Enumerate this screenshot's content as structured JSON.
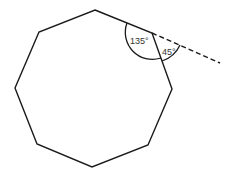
{
  "diagram": {
    "type": "regular-octagon-exterior-angle",
    "shape": "octagon",
    "stroke_color": "#1a1a1a",
    "background": "#ffffff",
    "vertices": [
      [
        95,
        10
      ],
      [
        152,
        33
      ],
      [
        172,
        89
      ],
      [
        148,
        145
      ],
      [
        92,
        167
      ],
      [
        37,
        144
      ],
      [
        15,
        88
      ],
      [
        39,
        32
      ]
    ],
    "extension_line": {
      "from": [
        152,
        33
      ],
      "to": [
        220,
        63
      ],
      "style": "dashed"
    },
    "angles": {
      "interior": {
        "label": "135°",
        "vertex": [
          152,
          33
        ]
      },
      "exterior": {
        "label": "45°",
        "vertex": [
          152,
          33
        ]
      }
    }
  }
}
